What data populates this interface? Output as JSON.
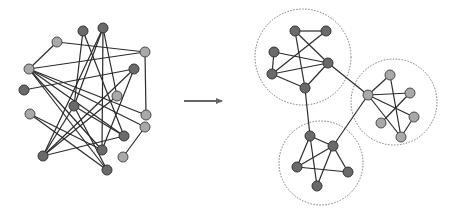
{
  "diagram": {
    "title": "Graph clustering: tangled graph to community clusters",
    "colors": {
      "background": "#ffffff",
      "edge": "#2b2b2b",
      "node_light_fill": "#a9a9a9",
      "node_light_stroke": "#4a4a4a",
      "node_dark_fill": "#6a6a6a",
      "node_dark_stroke": "#333333",
      "arrow": "#666666",
      "cluster_outline": "#777777"
    },
    "node_radius": 5,
    "left_graph": {
      "nodes": [
        {
          "id": "a",
          "x": 83,
          "y": 31,
          "tone": "dark"
        },
        {
          "id": "b",
          "x": 103,
          "y": 28,
          "tone": "dark"
        },
        {
          "id": "c",
          "x": 57,
          "y": 42,
          "tone": "light"
        },
        {
          "id": "d",
          "x": 145,
          "y": 52,
          "tone": "light"
        },
        {
          "id": "e",
          "x": 134,
          "y": 69,
          "tone": "dark"
        },
        {
          "id": "f",
          "x": 29,
          "y": 69,
          "tone": "light"
        },
        {
          "id": "g",
          "x": 24,
          "y": 90,
          "tone": "dark"
        },
        {
          "id": "h",
          "x": 117,
          "y": 96,
          "tone": "light"
        },
        {
          "id": "i",
          "x": 74,
          "y": 106,
          "tone": "dark"
        },
        {
          "id": "j",
          "x": 30,
          "y": 114,
          "tone": "light"
        },
        {
          "id": "k",
          "x": 146,
          "y": 115,
          "tone": "light"
        },
        {
          "id": "l",
          "x": 145,
          "y": 127,
          "tone": "light"
        },
        {
          "id": "m",
          "x": 124,
          "y": 136,
          "tone": "dark"
        },
        {
          "id": "n",
          "x": 102,
          "y": 150,
          "tone": "dark"
        },
        {
          "id": "o",
          "x": 123,
          "y": 157,
          "tone": "light"
        },
        {
          "id": "p",
          "x": 43,
          "y": 156,
          "tone": "dark"
        },
        {
          "id": "q",
          "x": 107,
          "y": 170,
          "tone": "dark"
        }
      ],
      "edges": [
        [
          "c",
          "d"
        ],
        [
          "c",
          "f"
        ],
        [
          "a",
          "i"
        ],
        [
          "a",
          "m"
        ],
        [
          "b",
          "h"
        ],
        [
          "b",
          "n"
        ],
        [
          "b",
          "p"
        ],
        [
          "b",
          "i"
        ],
        [
          "f",
          "d"
        ],
        [
          "f",
          "k"
        ],
        [
          "f",
          "m"
        ],
        [
          "f",
          "l"
        ],
        [
          "f",
          "n"
        ],
        [
          "f",
          "q"
        ],
        [
          "g",
          "e"
        ],
        [
          "e",
          "n"
        ],
        [
          "e",
          "p"
        ],
        [
          "d",
          "k"
        ],
        [
          "j",
          "n"
        ],
        [
          "j",
          "q"
        ],
        [
          "i",
          "m"
        ],
        [
          "i",
          "p"
        ],
        [
          "p",
          "m"
        ],
        [
          "h",
          "p"
        ],
        [
          "l",
          "o"
        ],
        [
          "i",
          "q"
        ]
      ]
    },
    "arrow": {
      "x1": 184,
      "y1": 101,
      "x2": 228,
      "y2": 101,
      "direction": "right"
    },
    "right_graph": {
      "clusters": [
        {
          "name": "cluster-top",
          "cx": 303,
          "cy": 57,
          "r": 48
        },
        {
          "name": "cluster-right",
          "cx": 394,
          "cy": 102,
          "r": 43
        },
        {
          "name": "cluster-bottom",
          "cx": 321,
          "cy": 163,
          "r": 42
        }
      ],
      "nodes": [
        {
          "id": "t1",
          "x": 295,
          "y": 31,
          "tone": "dark"
        },
        {
          "id": "t2",
          "x": 326,
          "y": 31,
          "tone": "dark"
        },
        {
          "id": "t3",
          "x": 274,
          "y": 52,
          "tone": "dark"
        },
        {
          "id": "t4",
          "x": 328,
          "y": 63,
          "tone": "dark"
        },
        {
          "id": "t5",
          "x": 272,
          "y": 74,
          "tone": "dark"
        },
        {
          "id": "t6",
          "x": 305,
          "y": 88,
          "tone": "dark"
        },
        {
          "id": "r1",
          "x": 390,
          "y": 75,
          "tone": "light"
        },
        {
          "id": "r2",
          "x": 368,
          "y": 95,
          "tone": "light"
        },
        {
          "id": "r3",
          "x": 410,
          "y": 93,
          "tone": "light"
        },
        {
          "id": "r4",
          "x": 414,
          "y": 117,
          "tone": "light"
        },
        {
          "id": "r5",
          "x": 381,
          "y": 123,
          "tone": "light"
        },
        {
          "id": "r6",
          "x": 401,
          "y": 137,
          "tone": "light"
        },
        {
          "id": "b1",
          "x": 310,
          "y": 136,
          "tone": "dark"
        },
        {
          "id": "b2",
          "x": 333,
          "y": 146,
          "tone": "dark"
        },
        {
          "id": "b3",
          "x": 297,
          "y": 167,
          "tone": "dark"
        },
        {
          "id": "b4",
          "x": 348,
          "y": 172,
          "tone": "dark"
        },
        {
          "id": "b5",
          "x": 317,
          "y": 186,
          "tone": "dark"
        }
      ],
      "edges": [
        [
          "t1",
          "t2"
        ],
        [
          "t1",
          "t4"
        ],
        [
          "t1",
          "t6"
        ],
        [
          "t2",
          "t5"
        ],
        [
          "t3",
          "t5"
        ],
        [
          "t3",
          "t4"
        ],
        [
          "t5",
          "t4"
        ],
        [
          "t5",
          "t6"
        ],
        [
          "t6",
          "t4"
        ],
        [
          "r2",
          "r1"
        ],
        [
          "r2",
          "r3"
        ],
        [
          "r2",
          "r4"
        ],
        [
          "r2",
          "r6"
        ],
        [
          "r1",
          "r6"
        ],
        [
          "r3",
          "r5"
        ],
        [
          "r4",
          "r6"
        ],
        [
          "b1",
          "b2"
        ],
        [
          "b1",
          "b3"
        ],
        [
          "b1",
          "b5"
        ],
        [
          "b2",
          "b3"
        ],
        [
          "b2",
          "b5"
        ],
        [
          "b2",
          "b4"
        ],
        [
          "b3",
          "b4"
        ],
        [
          "t4",
          "r2"
        ],
        [
          "t6",
          "b1"
        ],
        [
          "r2",
          "b2"
        ]
      ]
    }
  }
}
